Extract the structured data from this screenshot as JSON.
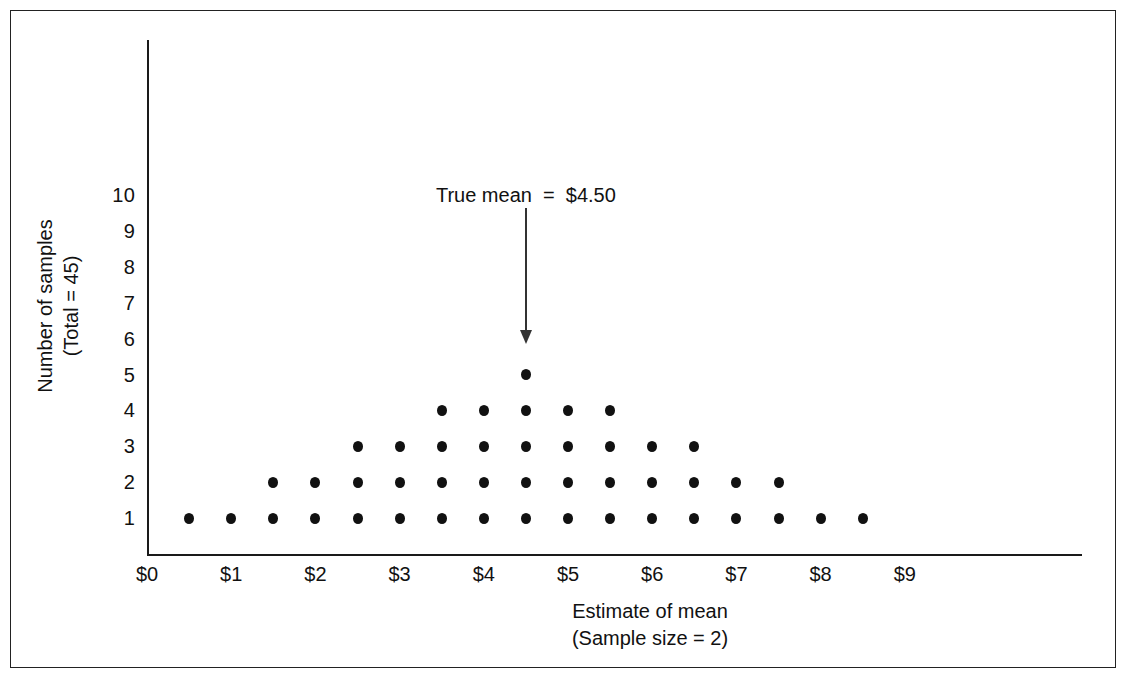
{
  "chart_data": {
    "type": "scatter",
    "title": "",
    "subtitle": "",
    "xlabel": "Estimate of mean",
    "xlabel_sub": "(Sample size = 2)",
    "ylabel": "Number of samples",
    "ylabel_sub": "(Total = 45)",
    "xlim": [
      0,
      9.5
    ],
    "ylim": [
      0,
      10.8
    ],
    "grid": false,
    "legend": null,
    "x_tick_labels": [
      "$0",
      "$1",
      "$2",
      "$3",
      "$4",
      "$5",
      "$6",
      "$7",
      "$8",
      "$9"
    ],
    "x_tick_values": [
      0,
      1,
      2,
      3,
      4,
      5,
      6,
      7,
      8,
      9
    ],
    "y_tick_labels": [
      "1",
      "2",
      "3",
      "4",
      "5",
      "6",
      "7",
      "8",
      "9",
      "10"
    ],
    "y_tick_values": [
      1,
      2,
      3,
      4,
      5,
      6,
      7,
      8,
      9,
      10
    ],
    "categories": [
      "$0.50",
      "$1.00",
      "$1.50",
      "$2.00",
      "$2.50",
      "$3.00",
      "$3.50",
      "$4.00",
      "$4.50",
      "$5.00",
      "$5.50",
      "$6.00",
      "$6.50",
      "$7.00",
      "$7.50",
      "$8.00",
      "$8.50"
    ],
    "x": [
      0.5,
      1.0,
      1.5,
      2.0,
      2.5,
      3.0,
      3.5,
      4.0,
      4.5,
      5.0,
      5.5,
      6.0,
      6.5,
      7.0,
      7.5,
      8.0,
      8.5
    ],
    "values": [
      1,
      1,
      2,
      2,
      3,
      3,
      4,
      4,
      5,
      4,
      4,
      3,
      3,
      2,
      2,
      1,
      1
    ],
    "total_dots": 45,
    "dot_color": "#111111",
    "axis_color": "#1a1a1a",
    "annotation": {
      "text": "True mean  =  $4.50",
      "x": 4.5,
      "arrow_target_y": 5.6
    }
  },
  "axis_titles": {
    "y_line1": "Number of samples",
    "y_line2": "(Total = 45)",
    "x_line1": "Estimate of mean",
    "x_line2": "(Sample size = 2)"
  }
}
